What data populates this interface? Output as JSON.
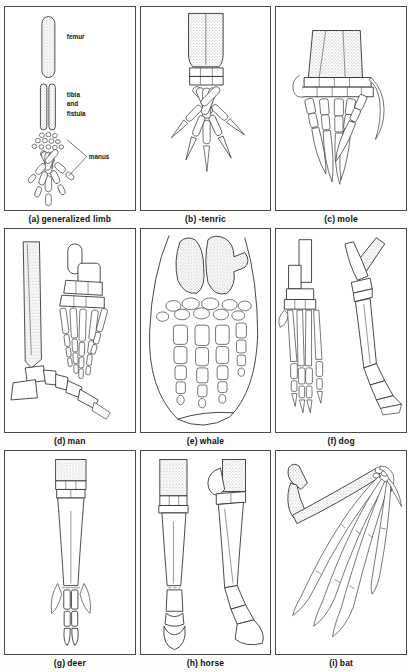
{
  "figure": {
    "kind": "comparative-anatomy-plate",
    "panel_count": 9,
    "background": "#fdfdfb",
    "ink": "#2a2a2a",
    "stipple_fill": "#9a9a9a"
  },
  "panels": [
    {
      "id": "a",
      "tag": "(a)",
      "caption": "generalized limb",
      "subject": "generalized limb",
      "labels": [
        {
          "name": "femur",
          "text": "femur"
        },
        {
          "name": "tibia-and-fistula",
          "text": "tibia\nand\nfistula",
          "line1": "tibia",
          "line2": "and",
          "line3": "fistula"
        },
        {
          "name": "manus",
          "text": "manus"
        }
      ],
      "digit_count": 5
    },
    {
      "id": "b",
      "tag": "(b)",
      "caption": "-tenric",
      "subject": "tenrec",
      "labels": [],
      "digit_count": 5
    },
    {
      "id": "c",
      "tag": "(c)",
      "caption": "mole",
      "subject": "mole",
      "labels": [],
      "digit_count": 5
    },
    {
      "id": "d",
      "tag": "(d)",
      "caption": "man",
      "subject": "man",
      "labels": [],
      "digit_count": 5
    },
    {
      "id": "e",
      "tag": "(e)",
      "caption": "whale",
      "subject": "whale",
      "labels": [],
      "digit_count": 4
    },
    {
      "id": "f",
      "tag": "(f)",
      "caption": "dog",
      "subject": "dog",
      "labels": [],
      "digit_count": 4
    },
    {
      "id": "g",
      "tag": "(g)",
      "caption": "deer",
      "subject": "deer",
      "labels": [],
      "digit_count": 2
    },
    {
      "id": "h",
      "tag": "(h)",
      "caption": "horse",
      "subject": "horse",
      "labels": [],
      "digit_count": 1
    },
    {
      "id": "i",
      "tag": "(i)",
      "caption": "bat",
      "subject": "bat",
      "labels": [],
      "digit_count": 5
    }
  ]
}
